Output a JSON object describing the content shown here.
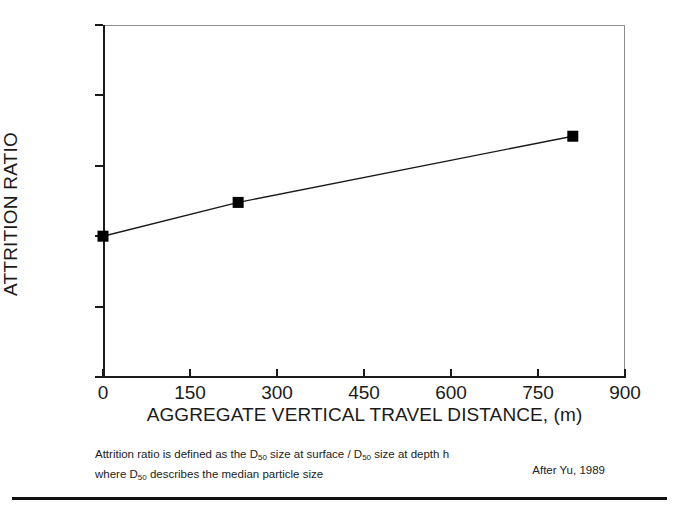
{
  "chart_data": {
    "type": "line",
    "title": "",
    "xlabel": "AGGREGATE VERTICAL TRAVEL DISTANCE, (m)",
    "ylabel": "ATTRITION RATIO",
    "xlim": [
      0,
      900
    ],
    "ylim": [
      0,
      2.5
    ],
    "xticks": [
      0,
      150,
      300,
      450,
      600,
      750,
      900
    ],
    "xtick_labels": [
      "0",
      "150",
      "300",
      "450",
      "600",
      "750",
      "900"
    ],
    "yticks": [
      0,
      0.5,
      1,
      1.5,
      2,
      2.5
    ],
    "ytick_labels": [
      "0",
      "0.5",
      "1",
      "1.5",
      "2",
      "2.5"
    ],
    "grid": false,
    "legend": null,
    "marker": "filled-square",
    "line_color": "#1a1a1a",
    "marker_color": "#000000",
    "x": [
      0,
      233,
      810
    ],
    "values": [
      1.0,
      1.24,
      1.71
    ],
    "series": [
      {
        "name": "Attrition ratio",
        "x": [
          0,
          233,
          810
        ],
        "values": [
          1.0,
          1.24,
          1.71
        ]
      }
    ]
  },
  "footnote": {
    "line1_part1": "Attrition ratio is defined as  the D",
    "line1_sub1": "50",
    "line1_part2": " size at surface / D",
    "line1_sub2": "50",
    "line1_part3": " size at depth h",
    "line2_part1": "where D",
    "line2_sub1": "50",
    "line2_part2": " describes the median particle size",
    "credit": "After  Yu, 1989"
  },
  "colors": {
    "background": "#ffffff",
    "axis": "#1a1a1a",
    "frame": "#8c8c8c",
    "text": "#1a1a1a",
    "rule": "#111111"
  }
}
